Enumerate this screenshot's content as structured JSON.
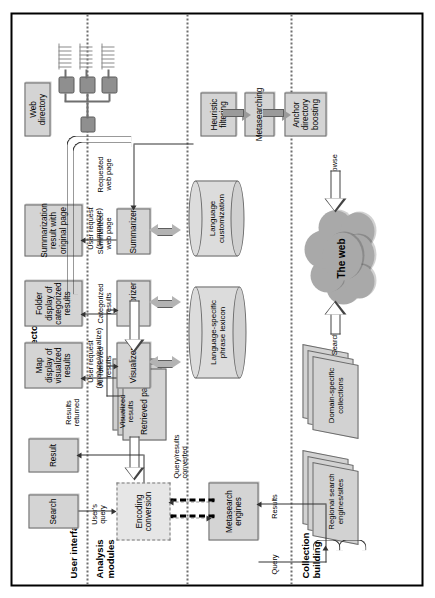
{
  "title": "A framework for web searching and browsing  in a multilingual world",
  "bands": [
    {
      "id": "user-interface",
      "label": "User interface"
    },
    {
      "id": "analysis-modules",
      "label": "Analysis\nmodules"
    },
    {
      "id": "web-directory-building",
      "label": "Web directory\nbuilding"
    },
    {
      "id": "collection-building",
      "label": "Collection\nbuilding"
    }
  ],
  "nodes": {
    "search": "Search",
    "result": "Result",
    "map_display": "Map display of visualized results",
    "folder_display": "Folder display of categorized results",
    "summarization_result": "Summarization result with original page",
    "web_directory": "Web directory",
    "retrieved_pages": "Retrieved pages",
    "encoding_conversion": "Encoding conversion",
    "metasearch_engines": "Metasearch engines",
    "visualizer": "Visualizer",
    "categorizer": "Categorizer",
    "summarizer": "Summarizer",
    "phrase_lexicon": "Language-specific phrase lexicon",
    "language_customization": "Language customization",
    "heuristic_filtering": "Heuristic filtering",
    "metasearching": "Metasearching",
    "anchor_directory_boosting": "Anchor directory boosting",
    "regional_search": "Regional search engines/sites",
    "domain_specific": "Domain-specific collections",
    "the_web": "The web"
  },
  "edge_labels": {
    "users_query": "User's query",
    "results_returned": "Results returned",
    "user_request_analyze": "User request (analyze/visualize)",
    "user_request_summarize": "User request (summarize)",
    "visualized_results": "Visualized results",
    "all_retrieved_results": "All retrieved results",
    "categorized_results": "Categorized results",
    "summarized_web_page": "Summarized web page",
    "requested_web_page": "Requested web page",
    "query_results_converted": "Query/results converted",
    "query": "Query",
    "results": "Results",
    "search_arrow": "Search",
    "browse_arrow": "Browse"
  },
  "colors": {
    "box_fill": "#d4d4d4",
    "box_stroke": "#6b6b6b",
    "cloud_fill": "#a9a9a9",
    "fat_arrow": "#9a9a9a",
    "band_separator": "#6e6e6e",
    "border": "#000000"
  }
}
